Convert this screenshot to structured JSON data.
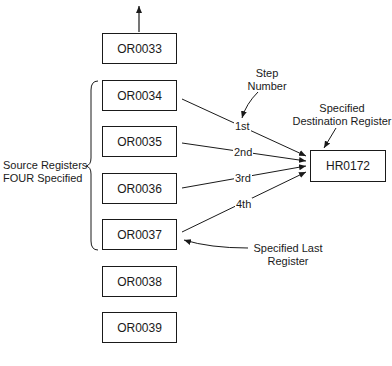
{
  "diagram": {
    "source_registers": [
      {
        "id": "OR0033",
        "top": 33
      },
      {
        "id": "OR0034",
        "top": 80
      },
      {
        "id": "OR0035",
        "top": 126
      },
      {
        "id": "OR0036",
        "top": 173
      },
      {
        "id": "OR0037",
        "top": 219
      },
      {
        "id": "OR0038",
        "top": 266
      },
      {
        "id": "OR0039",
        "top": 312
      }
    ],
    "destination_register": "HR0172",
    "steps": [
      "1st",
      "2nd",
      "3rd",
      "4th"
    ],
    "annotations": {
      "step_number_line1": "Step",
      "step_number_line2": "Number",
      "destination_line1": "Specified",
      "destination_line2": "Destination Register",
      "source_line1": "Source Registers",
      "source_line2": "FOUR Specified",
      "last_line1": "Specified Last",
      "last_line2": "Register"
    },
    "colors": {
      "ink": "#1a1a1a",
      "background": "#ffffff"
    }
  }
}
